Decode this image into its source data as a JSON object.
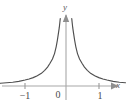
{
  "chart_data": {
    "type": "line",
    "title": "",
    "subtitle": "",
    "xlabel": "x",
    "ylabel": "y",
    "xlim": [
      -1.6,
      1.45
    ],
    "ylim": [
      -0.15,
      2.55
    ],
    "grid": false,
    "legend": null,
    "x_ticks": [
      {
        "value": -1,
        "label": "−1"
      },
      {
        "value": 0,
        "label": "0"
      },
      {
        "value": 1,
        "label": "1"
      }
    ],
    "y_ticks": [],
    "annotations": [],
    "asymptotes": {
      "vertical": [
        0
      ],
      "horizontal": [
        0
      ]
    },
    "series": [
      {
        "name": "left-branch",
        "comment": "x < 0 branch, decreasing toward horizontal asymptote y=0",
        "x": [
          -1.6,
          -1.45,
          -1.3,
          -1.15,
          -1.0,
          -0.9,
          -0.8,
          -0.7,
          -0.6,
          -0.52,
          -0.45,
          -0.39,
          -0.33,
          -0.28,
          -0.24,
          -0.21,
          -0.185,
          -0.165,
          -0.15,
          -0.14
        ],
        "y": [
          0.1,
          0.12,
          0.14,
          0.17,
          0.22,
          0.26,
          0.31,
          0.38,
          0.47,
          0.58,
          0.7,
          0.84,
          1.0,
          1.2,
          1.45,
          1.7,
          1.95,
          2.15,
          2.35,
          2.5
        ]
      },
      {
        "name": "right-branch",
        "comment": "x > 0 branch, mirror image of left branch",
        "x": [
          0.14,
          0.15,
          0.165,
          0.185,
          0.21,
          0.24,
          0.28,
          0.33,
          0.39,
          0.45,
          0.52,
          0.6,
          0.7,
          0.8,
          0.9,
          1.0,
          1.15,
          1.3,
          1.45
        ],
        "y": [
          2.5,
          2.35,
          2.15,
          1.95,
          1.7,
          1.45,
          1.2,
          1.0,
          0.84,
          0.7,
          0.58,
          0.47,
          0.38,
          0.31,
          0.26,
          0.22,
          0.17,
          0.14,
          0.12
        ]
      }
    ]
  },
  "labels": {
    "y_axis": "y",
    "x_axis": "x",
    "tick_neg1": "−1",
    "tick_origin": "0",
    "tick_pos1": "1"
  },
  "colors": {
    "background": "#ffffff",
    "curve": "#4f4f4f",
    "axis": "#a8a8a8",
    "tick": "#9a9a9a",
    "label_text": "#4a4a4a",
    "axis_label_text": "#5a5a5a"
  },
  "icons": {
    "x_axis_arrow": "arrow-right-icon",
    "y_axis_arrow": "arrow-up-icon"
  }
}
